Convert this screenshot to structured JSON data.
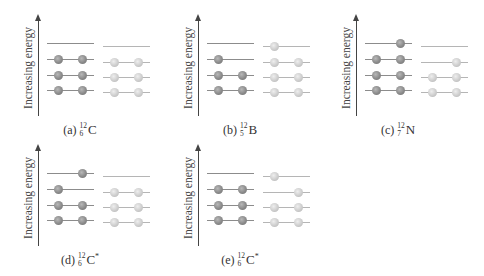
{
  "figure": {
    "y_axis_label": "Increasing energy",
    "colors": {
      "proton": "#8a8a8a",
      "neutron": "#cdcdcd",
      "proton_level": "#8c8c8c",
      "neutron_level": "#b5b5b5",
      "axis": "#444444"
    },
    "level_y_offsets": [
      90,
      75,
      59,
      43
    ],
    "neutron_level_y_offsets": [
      92,
      77,
      62,
      46
    ],
    "panels": [
      {
        "id": "a",
        "letter": "(a)",
        "mass": "12",
        "atomic": "6",
        "symbol": "C",
        "excited": "",
        "pos": {
          "x": 0,
          "y": 0
        },
        "protons": [
          [
            1,
            1
          ],
          [
            1,
            1
          ],
          [
            1,
            1
          ],
          [
            0,
            0
          ]
        ],
        "neutrons": [
          [
            1,
            1
          ],
          [
            1,
            1
          ],
          [
            1,
            1
          ],
          [
            0,
            0
          ]
        ]
      },
      {
        "id": "b",
        "letter": "(b)",
        "mass": "12",
        "atomic": "5",
        "symbol": "B",
        "excited": "",
        "pos": {
          "x": 160,
          "y": 0
        },
        "protons": [
          [
            1,
            1
          ],
          [
            1,
            1
          ],
          [
            1,
            0
          ],
          [
            0,
            0
          ]
        ],
        "neutrons": [
          [
            1,
            1
          ],
          [
            1,
            1
          ],
          [
            1,
            1
          ],
          [
            1,
            0
          ]
        ]
      },
      {
        "id": "c",
        "letter": "(c)",
        "mass": "12",
        "atomic": "7",
        "symbol": "N",
        "excited": "",
        "pos": {
          "x": 318,
          "y": 0
        },
        "protons": [
          [
            1,
            1
          ],
          [
            1,
            1
          ],
          [
            1,
            1
          ],
          [
            0,
            1
          ]
        ],
        "neutrons": [
          [
            1,
            1
          ],
          [
            1,
            1
          ],
          [
            0,
            1
          ],
          [
            0,
            0
          ]
        ]
      },
      {
        "id": "d",
        "letter": "(d)",
        "mass": "12",
        "atomic": "6",
        "symbol": "C",
        "excited": "*",
        "pos": {
          "x": 0,
          "y": 130
        },
        "protons": [
          [
            1,
            1
          ],
          [
            1,
            1
          ],
          [
            1,
            0
          ],
          [
            0,
            1
          ]
        ],
        "neutrons": [
          [
            1,
            1
          ],
          [
            1,
            1
          ],
          [
            1,
            1
          ],
          [
            0,
            0
          ]
        ]
      },
      {
        "id": "e",
        "letter": "(e)",
        "mass": "12",
        "atomic": "6",
        "symbol": "C",
        "excited": "*",
        "pos": {
          "x": 160,
          "y": 130
        },
        "protons": [
          [
            1,
            1
          ],
          [
            1,
            1
          ],
          [
            1,
            1
          ],
          [
            0,
            0
          ]
        ],
        "neutrons": [
          [
            1,
            1
          ],
          [
            1,
            1
          ],
          [
            0,
            1
          ],
          [
            1,
            0
          ]
        ]
      }
    ]
  }
}
